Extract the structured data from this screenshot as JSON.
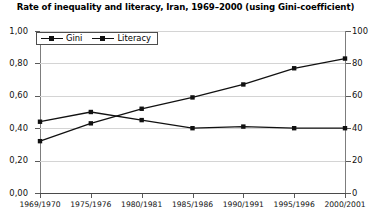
{
  "chart_data": {
    "type": "line",
    "title": "Rate of inequality and literacy, Iran, 1969–2000 (using Gini-coefficient)",
    "xlabel": "",
    "ylabel": "",
    "categories": [
      "1969/1970",
      "1975/1976",
      "1980/1981",
      "1985/1986",
      "1990/1991",
      "1995/1996",
      "2000/2001"
    ],
    "series": [
      {
        "name": "Gini",
        "axis": "left",
        "values": [
          0.44,
          0.5,
          0.45,
          0.4,
          0.41,
          0.4,
          0.4
        ],
        "color": "#111111",
        "marker": "square"
      },
      {
        "name": "Literacy",
        "axis": "right",
        "values": [
          32,
          43,
          52,
          59,
          67,
          77,
          83
        ],
        "color": "#111111",
        "marker": "square"
      }
    ],
    "left_axis": {
      "ticks": [
        "0,00",
        "0,20",
        "0,40",
        "0,60",
        "0,80",
        "1,00"
      ],
      "tick_values": [
        0.0,
        0.2,
        0.4,
        0.6,
        0.8,
        1.0
      ],
      "ylim": [
        0.0,
        1.0
      ]
    },
    "right_axis": {
      "ticks": [
        "0",
        "20",
        "40",
        "60",
        "80",
        "100"
      ],
      "tick_values": [
        0,
        20,
        40,
        60,
        80,
        100
      ],
      "ylim": [
        0,
        100
      ]
    },
    "legend": {
      "position": "top-left",
      "entries": [
        "Gini",
        "Literacy"
      ]
    },
    "grid": true,
    "gridline_color": "#d4d4d4",
    "background_color": "#ffffff"
  }
}
